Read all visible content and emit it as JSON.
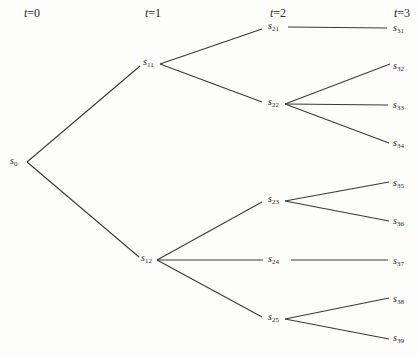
{
  "diagram": {
    "type": "tree",
    "title": "",
    "time_labels": [
      {
        "id": "t0",
        "var": "t",
        "eq": "=",
        "value": "0",
        "x": 32,
        "y": 13
      },
      {
        "id": "t1",
        "var": "t",
        "eq": "=",
        "value": "1",
        "x": 153,
        "y": 13
      },
      {
        "id": "t2",
        "var": "t",
        "eq": "=",
        "value": "2",
        "x": 278,
        "y": 13
      },
      {
        "id": "t3",
        "var": "t",
        "eq": "=",
        "value": "3",
        "x": 402,
        "y": 13
      }
    ],
    "nodes": [
      {
        "id": "s0",
        "base": "s",
        "sub": "0",
        "level": 0,
        "label_x": 10,
        "y": 162
      },
      {
        "id": "s11",
        "base": "s",
        "sub": "11",
        "level": 1,
        "label_x": 143,
        "y": 63
      },
      {
        "id": "s12",
        "base": "s",
        "sub": "12",
        "level": 1,
        "label_x": 141,
        "y": 259
      },
      {
        "id": "s21",
        "base": "s",
        "sub": "21",
        "level": 2,
        "label_x": 268,
        "y": 27
      },
      {
        "id": "s22",
        "base": "s",
        "sub": "22",
        "level": 2,
        "label_x": 268,
        "y": 103
      },
      {
        "id": "s23",
        "base": "s",
        "sub": "23",
        "level": 2,
        "label_x": 268,
        "y": 200
      },
      {
        "id": "s24",
        "base": "s",
        "sub": "24",
        "level": 2,
        "label_x": 268,
        "y": 260
      },
      {
        "id": "s25",
        "base": "s",
        "sub": "25",
        "level": 2,
        "label_x": 268,
        "y": 318
      },
      {
        "id": "s31",
        "base": "s",
        "sub": "31",
        "level": 3,
        "label_x": 393,
        "y": 29
      },
      {
        "id": "s32",
        "base": "s",
        "sub": "32",
        "level": 3,
        "label_x": 393,
        "y": 67
      },
      {
        "id": "s33",
        "base": "s",
        "sub": "33",
        "level": 3,
        "label_x": 393,
        "y": 106
      },
      {
        "id": "s34",
        "base": "s",
        "sub": "34",
        "level": 3,
        "label_x": 393,
        "y": 144
      },
      {
        "id": "s35",
        "base": "s",
        "sub": "35",
        "level": 3,
        "label_x": 393,
        "y": 184
      },
      {
        "id": "s36",
        "base": "s",
        "sub": "36",
        "level": 3,
        "label_x": 393,
        "y": 222
      },
      {
        "id": "s37",
        "base": "s",
        "sub": "37",
        "level": 3,
        "label_x": 393,
        "y": 262
      },
      {
        "id": "s38",
        "base": "s",
        "sub": "38",
        "level": 3,
        "label_x": 393,
        "y": 300
      },
      {
        "id": "s39",
        "base": "s",
        "sub": "39",
        "level": 3,
        "label_x": 393,
        "y": 339
      }
    ],
    "edges": [
      {
        "from": "s0",
        "to": "s11",
        "x1": 27,
        "y1": 162,
        "x2": 140,
        "y2": 66
      },
      {
        "from": "s0",
        "to": "s12",
        "x1": 27,
        "y1": 162,
        "x2": 139,
        "y2": 257
      },
      {
        "from": "s11",
        "to": "s21",
        "x1": 160,
        "y1": 64,
        "x2": 262,
        "y2": 29
      },
      {
        "from": "s11",
        "to": "s22",
        "x1": 160,
        "y1": 64,
        "x2": 262,
        "y2": 102
      },
      {
        "from": "s12",
        "to": "s23",
        "x1": 157,
        "y1": 260,
        "x2": 262,
        "y2": 202
      },
      {
        "from": "s12",
        "to": "s24",
        "x1": 157,
        "y1": 260,
        "x2": 263,
        "y2": 260
      },
      {
        "from": "s12",
        "to": "s25",
        "x1": 157,
        "y1": 260,
        "x2": 262,
        "y2": 317
      },
      {
        "from": "s21",
        "to": "s31",
        "x1": 288,
        "y1": 27,
        "x2": 387,
        "y2": 28
      },
      {
        "from": "s22",
        "to": "s32",
        "x1": 285,
        "y1": 104,
        "x2": 390,
        "y2": 64
      },
      {
        "from": "s22",
        "to": "s33",
        "x1": 285,
        "y1": 104,
        "x2": 388,
        "y2": 105
      },
      {
        "from": "s22",
        "to": "s34",
        "x1": 285,
        "y1": 104,
        "x2": 389,
        "y2": 143
      },
      {
        "from": "s23",
        "to": "s35",
        "x1": 285,
        "y1": 201,
        "x2": 389,
        "y2": 182
      },
      {
        "from": "s23",
        "to": "s36",
        "x1": 285,
        "y1": 201,
        "x2": 389,
        "y2": 221
      },
      {
        "from": "s24",
        "to": "s37",
        "x1": 291,
        "y1": 260,
        "x2": 388,
        "y2": 260
      },
      {
        "from": "s25",
        "to": "s38",
        "x1": 285,
        "y1": 319,
        "x2": 389,
        "y2": 298
      },
      {
        "from": "s25",
        "to": "s39",
        "x1": 285,
        "y1": 319,
        "x2": 389,
        "y2": 339
      }
    ],
    "colors": {
      "background": "#fdfdfc",
      "ink": "#2a2a2a",
      "edge": "#3a3a3a"
    }
  }
}
